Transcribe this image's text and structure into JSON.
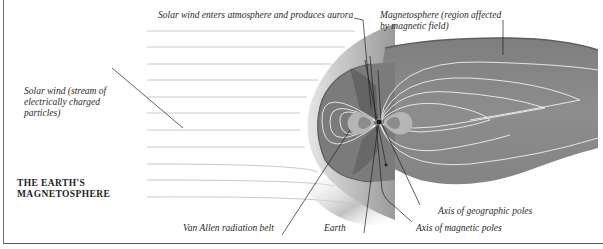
{
  "figure": {
    "title_line1": "THE EARTH'S",
    "title_line2": "MAGNETOSPHERE",
    "top_cut_text": "Protons"
  },
  "labels": {
    "solar_wind_aurora": "Solar wind enters atmosphere and produces aurora",
    "magnetosphere_line1": "Magnetosphere (region affected",
    "magnetosphere_line2": "by magnetic field)",
    "solar_wind_line1": "Solar wind (stream of",
    "solar_wind_line2": "electrically charged",
    "solar_wind_line3": "particles)",
    "van_allen": "Van Allen radiation belt",
    "earth": "Earth",
    "axis_geographic": "Axis of  geographic poles",
    "axis_magnetic": "Axis of  magnetic poles"
  },
  "colors": {
    "background": "#ffffff",
    "magnetosphere_fill": "#8a8a8a",
    "magnetosphere_dark": "#6f6f6f",
    "bow_shock_light": "#d8d8d8",
    "field_lines": "#efefef",
    "solar_wind_lines": "#bdbdbd",
    "leader_lines": "#1e1e1e",
    "text": "#2a2a2a"
  }
}
